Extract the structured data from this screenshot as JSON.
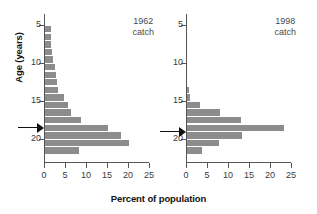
{
  "chart_data": {
    "type": "bar",
    "orientation": "horizontal",
    "title": "",
    "xlabel": "Percent of population",
    "ylabel": "Age (years)",
    "xlim": [
      0,
      25
    ],
    "ylim": [
      2,
      21.5
    ],
    "xticks": [
      0,
      5,
      10,
      15,
      20,
      25
    ],
    "yticks": [
      5,
      10,
      15,
      20
    ],
    "grid": false,
    "legend": null,
    "bar_color": "#8c8c8c",
    "panels": [
      {
        "name": "1962-catch",
        "label_line1": "1962",
        "label_line2": "catch",
        "marker_age": 6.5,
        "categories": [
          19,
          18,
          17,
          16,
          15,
          14,
          13,
          12,
          11,
          10,
          9,
          8,
          7,
          6,
          5,
          4,
          3
        ],
        "values": [
          1.5,
          1.5,
          1.5,
          1.6,
          2.0,
          2.3,
          2.6,
          2.8,
          3.0,
          4.5,
          5.4,
          6.2,
          8.6,
          15.0,
          18.2,
          20.0,
          8.2
        ]
      },
      {
        "name": "1998-catch",
        "label_line1": "1998",
        "label_line2": "catch",
        "marker_age": 6.0,
        "categories": [
          11,
          10,
          9,
          8,
          7,
          6,
          5,
          4,
          3
        ],
        "values": [
          0.5,
          0.6,
          3.0,
          7.8,
          12.8,
          23.0,
          13.2,
          7.5,
          3.6
        ]
      }
    ]
  },
  "axis": {
    "y_title": "Age (years)",
    "x_title": "Percent of population",
    "ytick_labels": [
      "20",
      "15",
      "10",
      "5"
    ],
    "xtick_labels": [
      "0",
      "5",
      "10",
      "15",
      "20",
      "25"
    ]
  },
  "panel_left": {
    "year": "1962",
    "catch_word": "catch"
  },
  "panel_right": {
    "year": "1998",
    "catch_word": "catch"
  }
}
